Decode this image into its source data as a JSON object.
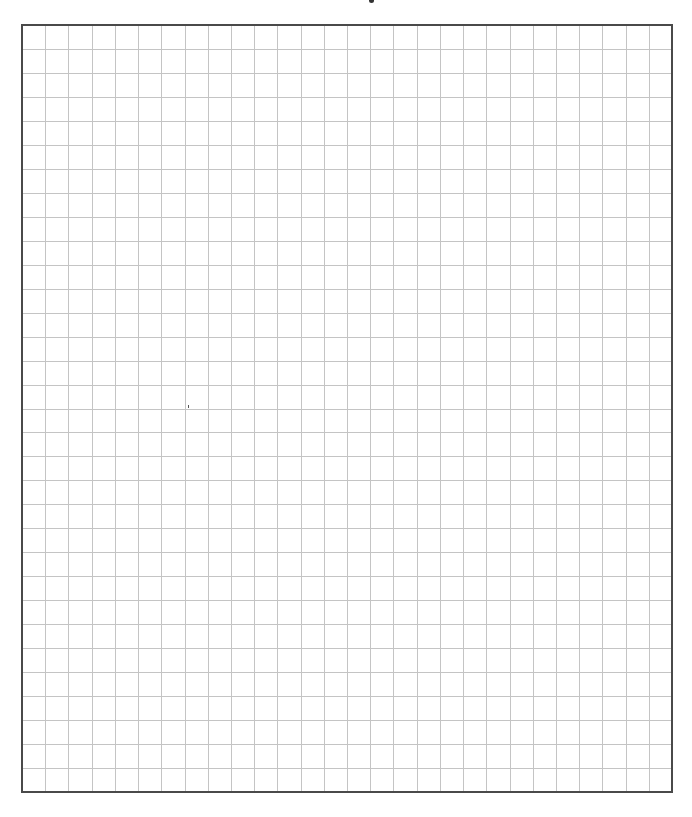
{
  "page": {
    "type": "graph-paper",
    "width": 692,
    "height": 817
  },
  "grid": {
    "left": 22,
    "top": 25,
    "right": 672,
    "bottom": 792,
    "columns": 28,
    "rows": 32,
    "border_color": "#4a4a4a",
    "border_width": 2,
    "line_color": "#c4c4c4",
    "line_width": 1
  },
  "header": {
    "text": ""
  },
  "footer": {
    "text": ""
  }
}
